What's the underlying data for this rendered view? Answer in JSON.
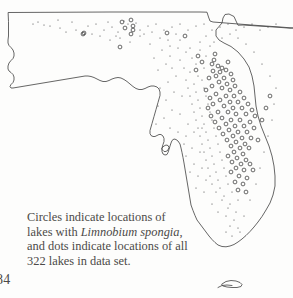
{
  "page": {
    "folio": "84",
    "background_color": "#fdfdfc",
    "ink_color": "#4a4a4a"
  },
  "caption": {
    "line1": "Circles indicate locations of",
    "line2_prefix": "lakes with ",
    "line2_species": "Limnobium spongia",
    "line2_suffix": ",",
    "line3": "and dots indicate locations of all",
    "line4": "322 lakes in data set."
  },
  "map": {
    "region_name": "Florida",
    "outline_color": "#4a4a4a",
    "marker_color": "#3a3a3a",
    "circle_radius": 1.9,
    "dot_radius": 0.55,
    "state_path": "M 8.5 12.5 L 110 12.0 L 200 12.0 L 207 12.2 L 208.5 17.0 L 210 21.0 L 213 22.0 L 232 23.5 L 258 25.5 L 280 27.0 L 293 28.0 L 293 28.0 L 290 28.2 L 277 27.2 L 258 26.0 L 243 25.0 L 238 25.2 L 236 21.0 L 234 16.5 L 229 14.0 L 225 14.5 L 223 18.0 L 222 23.0 L 219 26.5 L 216 30.0 L 216 36.0 L 219 40.0 L 224 43.0 L 231 46.5 L 238 52.0 L 244 59.0 L 249 67.0 L 252 76.0 L 254 86.0 L 255 96.0 L 256 106.0 L 258 116.0 L 261 126.0 L 265 136.0 L 269 146.0 L 272 156.0 L 274 166.0 L 275 176.0 L 275 186.0 L 273 195.0 L 270 203.0 L 266 210.0 L 262 216.5 L 258 222.0 L 254 227.0 L 250 231.5 L 246 235.5 L 242 239.0 L 238 242.0 L 234 244.5 L 230 246.0 L 226 246.8 L 222 246.5 L 218 245.0 L 215 242.5 L 212 239.5 L 209 236.0 L 206 232.0 L 203 228.0 L 200 224.0 L 197 220.0 L 195 215.5 L 193 210.5 L 191 205.0 L 190 199.0 L 189 193.0 L 188 187.0 L 187 181.0 L 186 175.0 L 185 169.0 L 184 163.0 L 183 157.5 L 182 152.5 L 181 148.0 L 180 144.0 L 178 141.0 L 176 139.5 L 174 139.0 L 172 140.5 L 171 143.0 L 170 146.0 L 169 149.5 L 168 152.5 L 167 154.5 L 165 155.0 L 163 154.0 L 162 151.5 L 162 148.0 L 163 144.5 L 164 141.5 L 164 138.5 L 163 136.0 L 161 134.5 L 159 134.5 L 157 135.5 L 155 136.5 L 153 136.5 L 151 135.5 L 150 133.5 L 150 130.5 L 151 127.0 L 152 123.5 L 153 120.0 L 154 116.5 L 155 113.0 L 156 109.5 L 157 106.0 L 158 102.5 L 159 99.0 L 160 95.5 L 160 92.0 L 159 89.0 L 157 87.0 L 154 86.0 L 151 86.0 L 148 87.0 L 145 88.5 L 142 89.5 L 139 89.5 L 136 88.5 L 133 86.5 L 130 84.0 L 127 81.5 L 124 79.5 L 121 78.0 L 118 77.5 L 115 78.0 L 112 79.0 L 109 80.5 L 106 81.5 L 103 81.5 L 100 80.5 L 97 79.0 L 94 77.5 L 91 76.5 L 88 76.0 L 85 76.0 L 82 76.5 L 79 77.0 L 76 77.5 L 73 78.0 L 70 78.5 L 67 79.0 L 64 79.5 L 61 80.0 L 58 80.5 L 55 81.0 L 52 81.5 L 49 82.0 L 46 82.5 L 43 83.0 L 40 83.5 L 37 84.0 L 34 84.5 L 31 85.0 L 28 85.5 L 25 86.0 L 22 86.5 L 19 87.0 L 16 87.5 L 13 88.0 L 11 88.0 L 10 86.5 L 11 84.5 L 13 82.5 L 14 80.0 L 14 77.0 L 13 74.5 L 11 72.5 L 9 71.0 L 8 69.0 L 8 66.0 L 9 63.0 L 11 60.5 L 13 58.5 L 14 56.0 L 14 53.0 L 13 50.0 L 11 47.5 L 9 45.5 L 8 43.0 L 8 40.0 L 8.5 36.0 L 8.5 30.0 L 8.5 22.0 Z",
    "tampa_bay_path": "M 162 148.0 L 164 146.0 L 166 145.0 L 168 145.5 L 169 147.5 L 168 150.0 L 166 151.5 L 164 151.5 L 162.5 150.0 Z",
    "keys_path": "M 222 284.0 L 226 281.5 L 231 280.5 L 236 281.0 L 240 282.5 L 242 284.5 L 241 286.5 L 237 287.5 L 232 287.5 L 227 287.0 L 223 286.0 Z",
    "keys_path2": "M 218 287.5 L 222 285.5 L 227 285.0 L 232 285.5"
  },
  "chart_data": {
    "type": "scatter",
    "xlabel": "Longitude (map x)",
    "ylabel": "Latitude (map y)",
    "legend": [
      {
        "name": "Lakes with Limnobium spongia",
        "marker": "open-circle"
      },
      {
        "name": "All lakes in data set",
        "marker": "dot"
      }
    ],
    "total_lakes": 322,
    "series": [
      {
        "name": "Lakes with Limnobium spongia",
        "marker": "open-circle",
        "points": [
          [
            131,
            20
          ],
          [
            133,
            26
          ],
          [
            133,
            30
          ],
          [
            83,
            34
          ],
          [
            122,
            22
          ],
          [
            125,
            28
          ],
          [
            131,
            34
          ],
          [
            84,
            33
          ],
          [
            167,
            33
          ],
          [
            185,
            36
          ],
          [
            120,
            47
          ],
          [
            215,
            54
          ],
          [
            214,
            60
          ],
          [
            212,
            64
          ],
          [
            228,
            62
          ],
          [
            218,
            66
          ],
          [
            222,
            68
          ],
          [
            213,
            71
          ],
          [
            220,
            72
          ],
          [
            226,
            70
          ],
          [
            231,
            74
          ],
          [
            216,
            76
          ],
          [
            224,
            78
          ],
          [
            209,
            78
          ],
          [
            233,
            80
          ],
          [
            219,
            82
          ],
          [
            227,
            84
          ],
          [
            212,
            86
          ],
          [
            235,
            86
          ],
          [
            222,
            88
          ],
          [
            230,
            90
          ],
          [
            206,
            90
          ],
          [
            240,
            92
          ],
          [
            216,
            94
          ],
          [
            226,
            96
          ],
          [
            234,
            96
          ],
          [
            210,
            98
          ],
          [
            244,
            98
          ],
          [
            220,
            100
          ],
          [
            230,
            102
          ],
          [
            238,
            102
          ],
          [
            213,
            104
          ],
          [
            248,
            104
          ],
          [
            224,
            106
          ],
          [
            233,
            108
          ],
          [
            242,
            108
          ],
          [
            208,
            108
          ],
          [
            252,
            110
          ],
          [
            218,
            112
          ],
          [
            228,
            112
          ],
          [
            236,
            114
          ],
          [
            246,
            114
          ],
          [
            211,
            116
          ],
          [
            255,
            116
          ],
          [
            222,
            118
          ],
          [
            231,
            120
          ],
          [
            240,
            120
          ],
          [
            250,
            122
          ],
          [
            215,
            122
          ],
          [
            226,
            124
          ],
          [
            235,
            126
          ],
          [
            244,
            126
          ],
          [
            254,
            128
          ],
          [
            219,
            128
          ],
          [
            229,
            130
          ],
          [
            238,
            132
          ],
          [
            247,
            132
          ],
          [
            223,
            134
          ],
          [
            233,
            136
          ],
          [
            242,
            138
          ],
          [
            251,
            138
          ],
          [
            227,
            140
          ],
          [
            236,
            142
          ],
          [
            245,
            144
          ],
          [
            231,
            146
          ],
          [
            240,
            148
          ],
          [
            249,
            148
          ],
          [
            234,
            152
          ],
          [
            243,
            154
          ],
          [
            228,
            156
          ],
          [
            237,
            158
          ],
          [
            246,
            160
          ],
          [
            232,
            162
          ],
          [
            241,
            164
          ],
          [
            250,
            164
          ],
          [
            236,
            168
          ],
          [
            244,
            170
          ],
          [
            231,
            172
          ],
          [
            239,
            176
          ],
          [
            247,
            178
          ],
          [
            235,
            182
          ],
          [
            243,
            184
          ],
          [
            238,
            190
          ],
          [
            246,
            192
          ],
          [
            253,
            170
          ],
          [
            258,
            140
          ],
          [
            262,
            120
          ],
          [
            266,
            108
          ],
          [
            270,
            96
          ],
          [
            198,
            56
          ],
          [
            202,
            62
          ],
          [
            196,
            70
          ]
        ]
      },
      {
        "name": "All lakes in data set",
        "marker": "dot",
        "points": [
          [
            33,
            24
          ],
          [
            38,
            22
          ],
          [
            44,
            25
          ],
          [
            60,
            28
          ],
          [
            72,
            22
          ],
          [
            76,
            30
          ],
          [
            88,
            26
          ],
          [
            96,
            24
          ],
          [
            104,
            30
          ],
          [
            112,
            27
          ],
          [
            118,
            32
          ],
          [
            124,
            21
          ],
          [
            128,
            24
          ],
          [
            136,
            23
          ],
          [
            140,
            30
          ],
          [
            148,
            26
          ],
          [
            156,
            24
          ],
          [
            164,
            30
          ],
          [
            172,
            27
          ],
          [
            180,
            24
          ],
          [
            188,
            30
          ],
          [
            196,
            26
          ],
          [
            204,
            24
          ],
          [
            212,
            30
          ],
          [
            220,
            27
          ],
          [
            228,
            24
          ],
          [
            236,
            30
          ],
          [
            244,
            27
          ],
          [
            252,
            24
          ],
          [
            260,
            30
          ],
          [
            268,
            27
          ],
          [
            276,
            24
          ],
          [
            100,
            36
          ],
          [
            110,
            40
          ],
          [
            120,
            38
          ],
          [
            130,
            42
          ],
          [
            140,
            36
          ],
          [
            150,
            44
          ],
          [
            160,
            38
          ],
          [
            170,
            46
          ],
          [
            180,
            40
          ],
          [
            190,
            48
          ],
          [
            200,
            42
          ],
          [
            210,
            46
          ],
          [
            186,
            52
          ],
          [
            192,
            58
          ],
          [
            200,
            50
          ],
          [
            206,
            56
          ],
          [
            196,
            64
          ],
          [
            204,
            68
          ],
          [
            190,
            72
          ],
          [
            198,
            76
          ],
          [
            186,
            80
          ],
          [
            194,
            84
          ],
          [
            202,
            80
          ],
          [
            188,
            88
          ],
          [
            196,
            92
          ],
          [
            204,
            88
          ],
          [
            190,
            96
          ],
          [
            198,
            100
          ],
          [
            206,
            96
          ],
          [
            192,
            104
          ],
          [
            200,
            108
          ],
          [
            208,
            104
          ],
          [
            194,
            112
          ],
          [
            202,
            116
          ],
          [
            210,
            112
          ],
          [
            196,
            120
          ],
          [
            204,
            124
          ],
          [
            212,
            120
          ],
          [
            198,
            128
          ],
          [
            206,
            132
          ],
          [
            214,
            128
          ],
          [
            200,
            136
          ],
          [
            208,
            140
          ],
          [
            216,
            136
          ],
          [
            202,
            144
          ],
          [
            210,
            148
          ],
          [
            218,
            144
          ],
          [
            204,
            152
          ],
          [
            212,
            156
          ],
          [
            220,
            152
          ],
          [
            206,
            160
          ],
          [
            214,
            164
          ],
          [
            222,
            160
          ],
          [
            208,
            168
          ],
          [
            216,
            172
          ],
          [
            224,
            168
          ],
          [
            210,
            176
          ],
          [
            218,
            180
          ],
          [
            226,
            176
          ],
          [
            212,
            184
          ],
          [
            220,
            188
          ],
          [
            228,
            184
          ],
          [
            216,
            192
          ],
          [
            224,
            196
          ],
          [
            232,
            192
          ],
          [
            222,
            200
          ],
          [
            230,
            204
          ],
          [
            238,
            200
          ],
          [
            228,
            208
          ],
          [
            236,
            212
          ],
          [
            226,
            216
          ],
          [
            234,
            220
          ],
          [
            230,
            226
          ],
          [
            238,
            228
          ],
          [
            244,
            216
          ],
          [
            250,
            200
          ],
          [
            256,
            184
          ],
          [
            260,
            168
          ],
          [
            264,
            152
          ],
          [
            268,
            136
          ],
          [
            272,
            120
          ],
          [
            274,
            104
          ],
          [
            276,
            88
          ],
          [
            270,
            76
          ],
          [
            262,
            64
          ],
          [
            254,
            52
          ],
          [
            246,
            44
          ],
          [
            238,
            38
          ],
          [
            230,
            34
          ],
          [
            222,
            38
          ],
          [
            214,
            42
          ],
          [
            206,
            36
          ],
          [
            176,
            34
          ],
          [
            168,
            40
          ],
          [
            178,
            48
          ],
          [
            170,
            56
          ],
          [
            162,
            50
          ],
          [
            154,
            58
          ],
          [
            166,
            64
          ],
          [
            158,
            70
          ],
          [
            172,
            68
          ],
          [
            180,
            60
          ],
          [
            184,
            68
          ],
          [
            176,
            76
          ],
          [
            168,
            82
          ],
          [
            160,
            88
          ],
          [
            174,
            92
          ],
          [
            182,
            96
          ],
          [
            166,
            100
          ],
          [
            158,
            106
          ],
          [
            172,
            110
          ],
          [
            180,
            114
          ],
          [
            164,
            118
          ],
          [
            156,
            124
          ],
          [
            170,
            128
          ],
          [
            178,
            132
          ],
          [
            186,
            136
          ],
          [
            194,
            132
          ],
          [
            202,
            128
          ],
          [
            188,
            124
          ],
          [
            184,
            144
          ],
          [
            192,
            148
          ],
          [
            200,
            152
          ],
          [
            186,
            156
          ],
          [
            194,
            164
          ],
          [
            202,
            168
          ],
          [
            190,
            172
          ],
          [
            198,
            176
          ],
          [
            206,
            180
          ],
          [
            196,
            188
          ],
          [
            204,
            192
          ],
          [
            212,
            204
          ],
          [
            218,
            212
          ],
          [
            226,
            232
          ],
          [
            232,
            236
          ],
          [
            240,
            232
          ],
          [
            58,
            20
          ],
          [
            50,
            26
          ],
          [
            66,
            32
          ],
          [
            92,
            34
          ],
          [
            108,
            22
          ],
          [
            116,
            36
          ],
          [
            144,
            34
          ],
          [
            152,
            32
          ]
        ]
      }
    ]
  }
}
